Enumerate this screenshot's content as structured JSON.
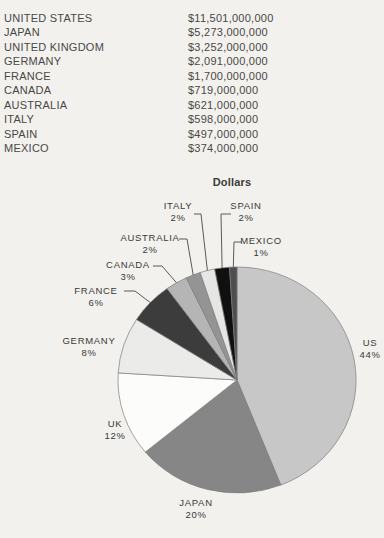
{
  "theme": {
    "page_bg": "#f2f1ee",
    "text_color": "#4a4845",
    "outline_color": "#7d7d7d",
    "leader_color": "#4a4a4a"
  },
  "table": {
    "rows": [
      {
        "country": "UNITED STATES",
        "amount": "$11,501,000,000"
      },
      {
        "country": "JAPAN",
        "amount": "$5,273,000,000"
      },
      {
        "country": "UNITED KINGDOM",
        "amount": "$3,252,000,000"
      },
      {
        "country": "GERMANY",
        "amount": "$2,091,000,000"
      },
      {
        "country": "FRANCE",
        "amount": "$1,700,000,000"
      },
      {
        "country": "CANADA",
        "amount": "$719,000,000"
      },
      {
        "country": "AUSTRALIA",
        "amount": "$621,000,000"
      },
      {
        "country": "ITALY",
        "amount": "$598,000,000"
      },
      {
        "country": "SPAIN",
        "amount": "$497,000,000"
      },
      {
        "country": "MEXICO",
        "amount": "$374,000,000"
      }
    ]
  },
  "chart_data": {
    "type": "pie",
    "title": "Dollars",
    "start_angle_deg": 0,
    "direction": "clockwise",
    "slices": [
      {
        "label": "US",
        "country": "UNITED STATES",
        "pct": 44,
        "amount_usd": 11501000000,
        "color": "#c7c7c7"
      },
      {
        "label": "JAPAN",
        "country": "JAPAN",
        "pct": 20,
        "amount_usd": 5273000000,
        "color": "#868686"
      },
      {
        "label": "UK",
        "country": "UNITED KINGDOM",
        "pct": 12,
        "amount_usd": 3252000000,
        "color": "#fcfcfa"
      },
      {
        "label": "GERMANY",
        "country": "GERMANY",
        "pct": 8,
        "amount_usd": 2091000000,
        "color": "#ebebe9"
      },
      {
        "label": "FRANCE",
        "country": "FRANCE",
        "pct": 6,
        "amount_usd": 1700000000,
        "color": "#3c3c3c"
      },
      {
        "label": "CANADA",
        "country": "CANADA",
        "pct": 3,
        "amount_usd": 719000000,
        "color": "#b5b5b5"
      },
      {
        "label": "AUSTRALIA",
        "country": "AUSTRALIA",
        "pct": 2,
        "amount_usd": 621000000,
        "color": "#949494"
      },
      {
        "label": "ITALY",
        "country": "ITALY",
        "pct": 2,
        "amount_usd": 598000000,
        "color": "#e6e6e4"
      },
      {
        "label": "SPAIN",
        "country": "SPAIN",
        "pct": 2,
        "amount_usd": 497000000,
        "color": "#101010"
      },
      {
        "label": "MEXICO",
        "country": "MEXICO",
        "pct": 1,
        "amount_usd": 374000000,
        "color": "#4e4e4e"
      }
    ],
    "label_layout": {
      "US": {
        "cx": 370,
        "top": 337,
        "leader": false
      },
      "JAPAN": {
        "cx": 196,
        "top": 497,
        "leader": false
      },
      "UK": {
        "cx": 115,
        "top": 418,
        "leader": false
      },
      "GERMANY": {
        "cx": 89,
        "top": 335,
        "leader": false
      },
      "FRANCE": {
        "cx": 96,
        "top": 285,
        "leader": true,
        "pts": [
          [
            124,
            291
          ],
          [
            135,
            291
          ]
        ]
      },
      "CANADA": {
        "cx": 128,
        "top": 259,
        "leader": true,
        "pts": [
          [
            153,
            266
          ],
          [
            162,
            266
          ]
        ]
      },
      "AUSTRALIA": {
        "cx": 150,
        "top": 232,
        "leader": true,
        "pts": [
          [
            179,
            239
          ],
          [
            187,
            239
          ]
        ]
      },
      "ITALY": {
        "cx": 178,
        "top": 200,
        "leader": true,
        "pts": [
          [
            194,
            214
          ],
          [
            201,
            214
          ]
        ]
      },
      "SPAIN": {
        "cx": 246,
        "top": 200,
        "leader": true,
        "pts": [
          [
            231,
            214
          ],
          [
            221,
            214
          ]
        ]
      },
      "MEXICO": {
        "cx": 261,
        "top": 235,
        "leader": true,
        "pts": [
          [
            242,
            242
          ],
          [
            234,
            242
          ]
        ]
      }
    }
  }
}
